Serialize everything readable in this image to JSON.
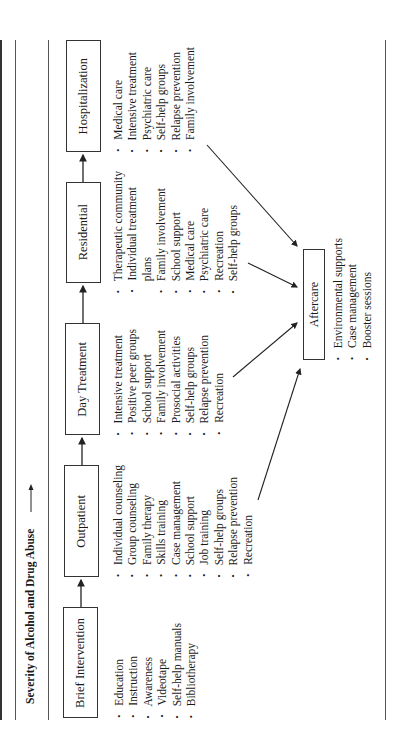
{
  "title": "Severity of Alcohol and Drug Abuse",
  "title_arrow": "right-arrow",
  "levels": [
    {
      "name": "Brief Intervention",
      "items": [
        "Education",
        "Instruction",
        "Awareness",
        "Videotape",
        "Self-help manuals",
        "Bibliotherapy"
      ]
    },
    {
      "name": "Outpatient",
      "items": [
        "Individual counseling",
        "Group counseling",
        "Family therapy",
        "Skills training",
        "Case management",
        "School support",
        "Job training",
        "Self-help groups",
        "Relapse prevention",
        "Recreation"
      ]
    },
    {
      "name": "Day Treatment",
      "items": [
        "Intensive treatment",
        "Positive peer groups",
        "School support",
        "Family involvement",
        "Prosocial activities",
        "Self-help groups",
        "Relapse prevention",
        "Recreation"
      ]
    },
    {
      "name": "Residential",
      "items": [
        "Therapeutic community",
        "Individual treatment",
        "plans",
        "Family involvement",
        "School support",
        "Medical care",
        "Psychiatric care",
        "Recreation",
        "Self-help groups"
      ]
    },
    {
      "name": "Hospitalization",
      "items": [
        "Medical care",
        "Intensive treatment",
        "Psychiatric care",
        "Self-help groups",
        "Relapse prevention",
        "Family involvement"
      ]
    }
  ],
  "aftercare": {
    "name": "Aftercare",
    "items": [
      "Environmental supports",
      "Case management",
      "Booster sessions"
    ]
  },
  "bullet": "•",
  "colors": {
    "line": "#333333",
    "text": "#1a1a1a",
    "background": "#ffffff"
  }
}
